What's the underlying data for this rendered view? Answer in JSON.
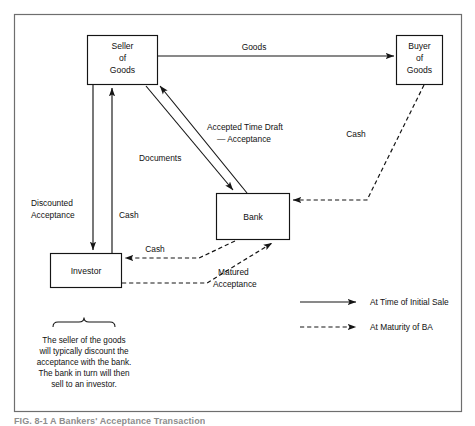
{
  "figure": {
    "caption": "FIG. 8-1  A Bankers' Acceptance Transaction",
    "frame": {
      "x": 14,
      "y": 14,
      "width": 448,
      "height": 398
    }
  },
  "entities": [
    {
      "id": "seller",
      "label_lines": [
        "Seller",
        "of",
        "Goods"
      ],
      "x": 87,
      "y": 35,
      "width": 71,
      "height": 50
    },
    {
      "id": "buyer",
      "label_lines": [
        "Buyer",
        "of",
        "Goods"
      ],
      "x": 396,
      "y": 35,
      "width": 47,
      "height": 50
    },
    {
      "id": "bank",
      "label_lines": [
        "Bank"
      ],
      "x": 216,
      "y": 193,
      "width": 74,
      "height": 47
    },
    {
      "id": "investor",
      "label_lines": [
        "Investor"
      ],
      "x": 50,
      "y": 253,
      "width": 72,
      "height": 35
    }
  ],
  "flows": [
    {
      "id": "goods",
      "label_lines": [
        "Goods"
      ],
      "style": "solid",
      "from": "seller",
      "to": "buyer"
    },
    {
      "id": "cash-buyer-bank",
      "label_lines": [
        "Cash"
      ],
      "style": "dashed",
      "from": "buyer",
      "to": "bank"
    },
    {
      "id": "documents",
      "label_lines": [
        "Documents"
      ],
      "style": "solid",
      "from": "seller",
      "to": "bank"
    },
    {
      "id": "accepted-time-draft",
      "label_lines": [
        "Accepted Time Draft",
        "— Acceptance"
      ],
      "style": "solid",
      "from": "bank",
      "to": "seller"
    },
    {
      "id": "discounted-acceptance",
      "label_lines": [
        "Discounted",
        "Acceptance"
      ],
      "style": "solid",
      "from": "seller",
      "to": "investor"
    },
    {
      "id": "cash-investor-seller",
      "label_lines": [
        "Cash"
      ],
      "style": "solid",
      "from": "investor",
      "to": "seller"
    },
    {
      "id": "cash-bank-investor",
      "label_lines": [
        "Cash"
      ],
      "style": "dashed",
      "from": "bank",
      "to": "investor"
    },
    {
      "id": "matured-acceptance",
      "label_lines": [
        "Matured",
        "Acceptance"
      ],
      "style": "dashed",
      "from": "investor",
      "to": "bank"
    }
  ],
  "legend": {
    "items": [
      {
        "id": "initial-sale",
        "style": "solid",
        "label": "At Time of Initial Sale"
      },
      {
        "id": "maturity-ba",
        "style": "dashed",
        "label": "At Maturity of BA"
      }
    ]
  },
  "note": {
    "lines": [
      "The seller of the goods",
      "will typically discount the",
      "acceptance with the bank.",
      "The bank in turn will then",
      "sell to an investor."
    ]
  },
  "colors": {
    "ink": "#151515",
    "frame": "#6e6e6e",
    "paper": "#ffffff"
  }
}
